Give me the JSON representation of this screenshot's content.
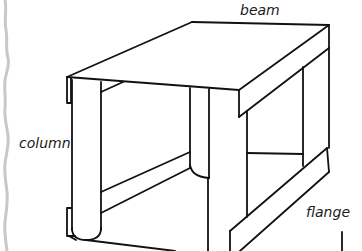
{
  "diagram": {
    "labels": {
      "beam": "beam",
      "column": "column",
      "flange": "flange"
    },
    "colors": {
      "line": "#111111",
      "background": "#ffffff",
      "torn_edge": "#c8c8c8"
    },
    "elements": [
      {
        "name": "beam",
        "description": "Flat top surface / beam of the frame"
      },
      {
        "name": "column",
        "description": "Rounded vertical column posts"
      },
      {
        "name": "flange",
        "description": "Diagonal lower flange strip on right side"
      }
    ]
  }
}
